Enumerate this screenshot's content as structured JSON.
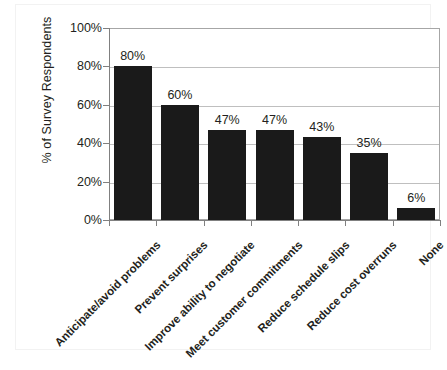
{
  "chart_data": {
    "type": "bar",
    "title": "",
    "subtitle": "",
    "xlabel": "",
    "ylabel": "% of Survey Respondents",
    "ylim": [
      0,
      100
    ],
    "yticks": [
      "0%",
      "20%",
      "40%",
      "60%",
      "80%",
      "100%"
    ],
    "ytick_values": [
      0,
      20,
      40,
      60,
      80,
      100
    ],
    "grid": true,
    "legend": "none",
    "bar_color": "#1a1a1a",
    "gridline_color": "#bfbfbf",
    "axis_color": "#808080",
    "categories": [
      "Anticipate/avoid problems",
      "Prevent surprises",
      "Improve ability to negotiate",
      "Meet customer commitments",
      "Reduce schedule slips",
      "Reduce cost overruns",
      "None"
    ],
    "values": [
      80,
      60,
      47,
      47,
      43,
      35,
      6
    ],
    "value_labels": [
      "80%",
      "60%",
      "47%",
      "47%",
      "43%",
      "35%",
      "6%"
    ]
  }
}
